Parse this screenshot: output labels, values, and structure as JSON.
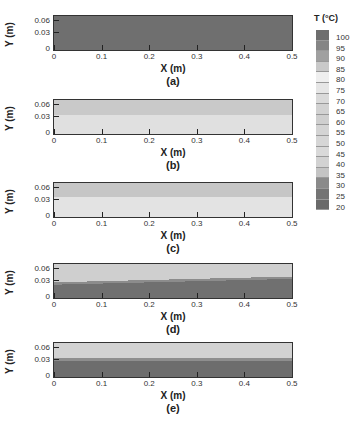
{
  "chart_data": {
    "type": "heatmap",
    "title": "",
    "colorbar": {
      "title": "T (°C)",
      "ticks": [
        "100",
        "95",
        "90",
        "85",
        "80",
        "75",
        "70",
        "65",
        "60",
        "55",
        "50",
        "45",
        "40",
        "35",
        "30",
        "25",
        "20"
      ],
      "colors": [
        "#6e6e6e",
        "#858585",
        "#a0a0a0",
        "#c9c9c9",
        "#efefef",
        "#e6e6e6",
        "#dadada",
        "#d2d2d2",
        "#cfcfcf",
        "#d4d4d4",
        "#d6d6d6",
        "#d9d9d9",
        "#d2d2d2",
        "#c4c4c4",
        "#8a8a8a",
        "#747474",
        "#6a6a6a"
      ]
    },
    "xlabel": "X (m)",
    "ylabel": "Y (m)",
    "xlim": [
      0,
      0.5
    ],
    "ylim": [
      0,
      0.07
    ],
    "xticks": [
      "0",
      "0.1",
      "0.2",
      "0.3",
      "0.4",
      "0.5"
    ],
    "yticks": [
      "0.06",
      "0.03",
      "0"
    ],
    "panels": [
      {
        "label": "(a)",
        "description": "uniform dark field",
        "layers": [
          {
            "from": 0,
            "to": 1,
            "color": "#6f6f6f",
            "temp": "~95-100"
          }
        ]
      },
      {
        "label": "(b)",
        "description": "upper band ~ medium gray, lower band light",
        "layers": [
          {
            "from": 0,
            "to": 0.45,
            "color": "#c9c9c9",
            "temp": "~40-45"
          },
          {
            "from": 0.45,
            "to": 1,
            "color": "#e0e0e0",
            "temp": "~50-60"
          }
        ]
      },
      {
        "label": "(c)",
        "description": "upper band medium gray, lower light",
        "layers": [
          {
            "from": 0,
            "to": 0.42,
            "color": "#c6c6c6",
            "temp": "~40-45"
          },
          {
            "from": 0.42,
            "to": 1,
            "color": "#e3e3e3",
            "temp": "~50-60"
          }
        ]
      },
      {
        "label": "(d)",
        "description": "upper light, lower dark, interface rising toward x=0.5",
        "layers": [
          {
            "from": 0,
            "to": 0.46,
            "color": "#cfcfcf",
            "temp": "~40"
          },
          {
            "from": 0.46,
            "to": 0.52,
            "color": "#8c8c8c",
            "temp": "~30"
          },
          {
            "from": 0.52,
            "to": 1,
            "color": "#707070",
            "temp": "~20-25"
          }
        ]
      },
      {
        "label": "(e)",
        "description": "upper light, lower dark interface at y~0.035",
        "layers": [
          {
            "from": 0,
            "to": 0.45,
            "color": "#d2d2d2",
            "temp": "~40"
          },
          {
            "from": 0.45,
            "to": 0.52,
            "color": "#8e8e8e",
            "temp": "~30"
          },
          {
            "from": 0.52,
            "to": 1,
            "color": "#6d6d6d",
            "temp": "~20-25"
          }
        ]
      }
    ]
  },
  "axes": {
    "xlabel": "X (m)",
    "ylabel": "Y (m)",
    "xticks": [
      "0",
      "0.1",
      "0.2",
      "0.3",
      "0.4",
      "0.5"
    ],
    "yticks": [
      "0.06",
      "0.03",
      "0"
    ]
  },
  "captions": [
    "(a)",
    "(b)",
    "(c)",
    "(d)",
    "(e)"
  ],
  "colorbar_title": "T (°C)"
}
